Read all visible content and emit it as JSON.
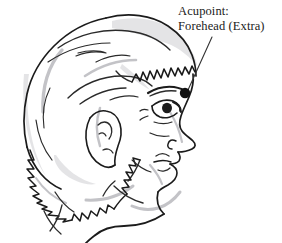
{
  "figure": {
    "type": "anatomical-line-drawing",
    "background_color": "#ffffff",
    "ink_color": "#1a1a1a",
    "shadow_color": "#b8b8bc"
  },
  "annotation": {
    "label_line_1": "Acupoint:",
    "label_line_2": "Forehead (Extra)",
    "marker_name": "acupoint-marker",
    "marker_color": "#111111",
    "marker_x": 185,
    "marker_y": 93,
    "marker_radius": 5,
    "leader_line_from_x": 212,
    "leader_line_from_y": 37,
    "leader_line_to_x": 188,
    "leader_line_to_y": 90,
    "leader_line_color": "#333333"
  }
}
